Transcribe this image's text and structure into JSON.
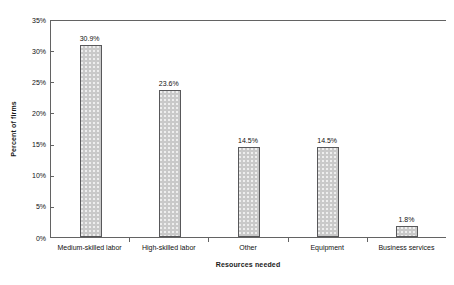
{
  "chart_data": {
    "type": "bar",
    "title": "",
    "xlabel": "Resources needed",
    "ylabel": "Percent of firms",
    "categories": [
      "Medium-skilled labor",
      "High-skilled labor",
      "Other",
      "Equipment",
      "Business services"
    ],
    "values": [
      30.9,
      23.6,
      14.5,
      14.5,
      1.8
    ],
    "value_labels": [
      "30.9%",
      "23.6%",
      "14.5%",
      "14.5%",
      "1.8%"
    ],
    "ylim": [
      0,
      35
    ],
    "yticks": [
      0,
      5,
      10,
      15,
      20,
      25,
      30,
      35
    ],
    "ytick_labels": [
      "0%",
      "5%",
      "10%",
      "15%",
      "20%",
      "25%",
      "30%",
      "35%"
    ],
    "grid": false,
    "legend": false,
    "bar_fill_color": "#c9c9c9",
    "bar_border_color": "#58585a",
    "axis_color": "#636363"
  }
}
